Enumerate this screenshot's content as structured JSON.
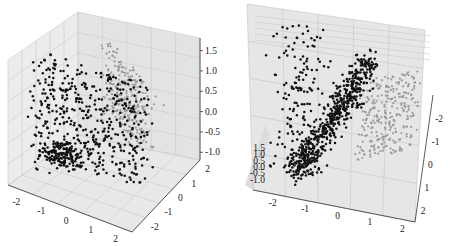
{
  "chart_data": [
    {
      "type": "scatter",
      "subtype": "3d-scatter",
      "title": "",
      "xlabel": "",
      "ylabel": "",
      "zlabel": "",
      "x_ticks": [
        "-2",
        "-1",
        "0",
        "1",
        "2"
      ],
      "y_ticks": [
        "-2",
        "-1",
        "0",
        "1",
        "2"
      ],
      "z_ticks": [
        "-1.0",
        "-0.5",
        "0.0",
        "0.5",
        "1.0",
        "1.5"
      ],
      "xlim": [
        -2.5,
        2.5
      ],
      "ylim": [
        -2.5,
        2.5
      ],
      "zlim": [
        -1.3,
        1.7
      ],
      "grid": true,
      "legend": null,
      "series": [
        {
          "name": "class-black",
          "color": "#111111",
          "approx_points": 600,
          "description": "dense vertical sheet spanning z -1.2..1.2, near front"
        },
        {
          "name": "class-gray",
          "color": "#9a9a9a",
          "approx_points": 300,
          "description": "narrower sheet behind, upper right"
        }
      ]
    },
    {
      "type": "scatter",
      "subtype": "3d-scatter",
      "title": "",
      "xlabel": "",
      "ylabel": "",
      "zlabel": "",
      "x_ticks": [
        "-2",
        "-1",
        "0",
        "1",
        "2"
      ],
      "y_ticks": [
        "-2",
        "-1",
        "0",
        "1",
        "2"
      ],
      "z_ticks": [
        "-1.0",
        "-0.5",
        "0.0",
        "0.5",
        "1.0",
        "1.5"
      ],
      "xlim": [
        -2.5,
        2.5
      ],
      "ylim": [
        -2.5,
        2.5
      ],
      "zlim": [
        -1.3,
        1.7
      ],
      "grid": true,
      "legend": null,
      "series": [
        {
          "name": "class-black",
          "color": "#111111",
          "approx_points": 600,
          "description": "elongated diagonal band viewed from above"
        },
        {
          "name": "class-gray",
          "color": "#9a9a9a",
          "approx_points": 300,
          "description": "separate cluster to the right"
        }
      ]
    }
  ]
}
